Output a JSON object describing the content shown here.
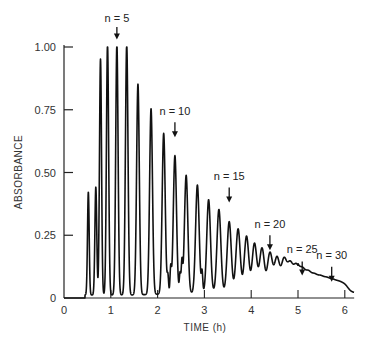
{
  "chart_data": {
    "type": "line",
    "title": "",
    "xlabel": "TIME (h)",
    "ylabel": "ABSORBANCE",
    "xlim": [
      0,
      6.2
    ],
    "ylim": [
      0,
      1.0
    ],
    "x_ticks": [
      0,
      1,
      2,
      3,
      4,
      5,
      6
    ],
    "x_tick_labels": [
      "0",
      "1",
      "2",
      "3",
      "4",
      "5",
      "6"
    ],
    "y_ticks": [
      0,
      0.25,
      0.5,
      0.75,
      1.0
    ],
    "y_tick_labels": [
      "0",
      "0.25",
      "0.50",
      "0.75",
      "1.00"
    ],
    "grid": false,
    "legend": null,
    "series": [
      {
        "name": "absorbance peaks",
        "peaks": [
          {
            "t": 0.52,
            "a": 0.41
          },
          {
            "t": 0.68,
            "a": 0.43
          },
          {
            "t": 0.78,
            "a": 0.94
          },
          {
            "t": 0.93,
            "a": 1.0
          },
          {
            "t": 1.13,
            "a": 1.0
          },
          {
            "t": 1.34,
            "a": 1.0
          },
          {
            "t": 1.58,
            "a": 0.84
          },
          {
            "t": 1.86,
            "a": 0.74
          },
          {
            "t": 2.13,
            "a": 0.64
          },
          {
            "t": 2.37,
            "a": 0.55
          },
          {
            "t": 2.61,
            "a": 0.47
          },
          {
            "t": 2.85,
            "a": 0.43
          },
          {
            "t": 3.09,
            "a": 0.37
          },
          {
            "t": 3.31,
            "a": 0.33
          },
          {
            "t": 3.53,
            "a": 0.28
          },
          {
            "t": 3.72,
            "a": 0.25
          },
          {
            "t": 3.9,
            "a": 0.22
          },
          {
            "t": 4.07,
            "a": 0.19
          },
          {
            "t": 4.23,
            "a": 0.17
          },
          {
            "t": 4.4,
            "a": 0.15
          },
          {
            "t": 4.55,
            "a": 0.13
          },
          {
            "t": 4.7,
            "a": 0.12
          },
          {
            "t": 4.83,
            "a": 0.1
          },
          {
            "t": 4.96,
            "a": 0.09
          },
          {
            "t": 5.09,
            "a": 0.07
          },
          {
            "t": 5.22,
            "a": 0.06
          },
          {
            "t": 5.35,
            "a": 0.05
          },
          {
            "t": 5.48,
            "a": 0.045
          },
          {
            "t": 5.61,
            "a": 0.04
          },
          {
            "t": 5.74,
            "a": 0.035
          },
          {
            "t": 5.87,
            "a": 0.03
          },
          {
            "t": 6.0,
            "a": 0.025
          }
        ],
        "side_bumps": [
          {
            "t": 2.22,
            "a": 0.07
          },
          {
            "t": 2.28,
            "a": 0.1
          },
          {
            "t": 2.48,
            "a": 0.08
          },
          {
            "t": 2.52,
            "a": 0.12
          },
          {
            "t": 2.95,
            "a": 0.08
          }
        ]
      }
    ],
    "annotations": [
      {
        "label": "n = 5",
        "t": 1.13,
        "label_y": 1.1,
        "arrow_top": 1.08,
        "arrow_bottom": 1.03
      },
      {
        "label": "n = 10",
        "t": 2.37,
        "label_y": 0.73,
        "arrow_top": 0.7,
        "arrow_bottom": 0.64
      },
      {
        "label": "n = 15",
        "t": 3.53,
        "label_y": 0.47,
        "arrow_top": 0.44,
        "arrow_bottom": 0.38
      },
      {
        "label": "n = 20",
        "t": 4.4,
        "label_y": 0.28,
        "arrow_top": 0.25,
        "arrow_bottom": 0.19
      },
      {
        "label": "n = 25",
        "t": 5.09,
        "label_y": 0.18,
        "arrow_top": 0.145,
        "arrow_bottom": 0.09
      },
      {
        "label": "n = 30",
        "t": 5.72,
        "label_y": 0.155,
        "arrow_top": 0.125,
        "arrow_bottom": 0.065
      }
    ]
  }
}
